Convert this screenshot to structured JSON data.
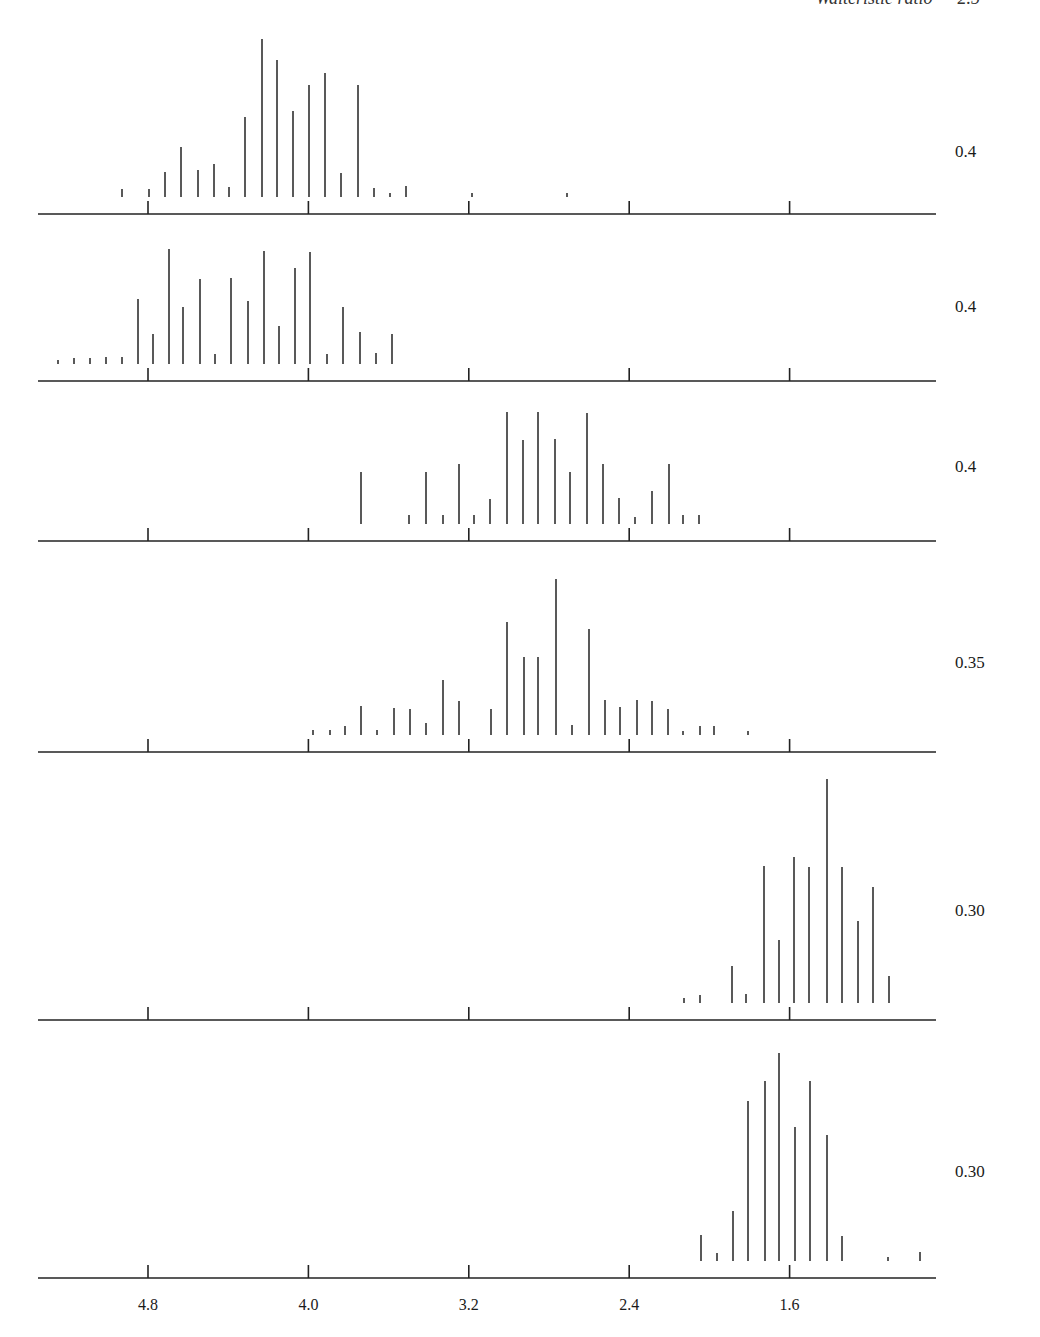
{
  "header": {
    "text": "Waiteristic ratio — 2.5"
  },
  "axis": {
    "ticks": [
      4.8,
      4.0,
      3.2,
      2.4,
      1.6
    ],
    "tick_labels": [
      "4.8",
      "4.0",
      "3.2",
      "2.4",
      "1.6"
    ],
    "px_per_unit": 200.5,
    "x_at_4_8": 148,
    "x_start": 38,
    "x_end": 936
  },
  "chart_data": {
    "type": "bar",
    "title": "",
    "xlabel": "",
    "ylabel": "",
    "xlim": [
      5.35,
      0.9
    ],
    "grid": false,
    "panels": [
      {
        "label": "0.4",
        "baseline_y": 214,
        "label_y": 152,
        "bars": [
          {
            "x": 122,
            "h": 8
          },
          {
            "x": 149,
            "h": 8
          },
          {
            "x": 165,
            "h": 25
          },
          {
            "x": 181,
            "h": 50
          },
          {
            "x": 198,
            "h": 27
          },
          {
            "x": 214,
            "h": 33
          },
          {
            "x": 229,
            "h": 10
          },
          {
            "x": 245,
            "h": 80
          },
          {
            "x": 262,
            "h": 158
          },
          {
            "x": 277,
            "h": 137
          },
          {
            "x": 293,
            "h": 86
          },
          {
            "x": 309,
            "h": 112
          },
          {
            "x": 325,
            "h": 124
          },
          {
            "x": 341,
            "h": 24
          },
          {
            "x": 358,
            "h": 112
          },
          {
            "x": 374,
            "h": 9
          },
          {
            "x": 390,
            "h": 4
          },
          {
            "x": 406,
            "h": 11
          },
          {
            "x": 472,
            "h": 4
          },
          {
            "x": 567,
            "h": 4
          }
        ]
      },
      {
        "label": "0.4",
        "baseline_y": 381,
        "label_y": 307,
        "bars": [
          {
            "x": 58,
            "h": 4
          },
          {
            "x": 74,
            "h": 6
          },
          {
            "x": 90,
            "h": 6
          },
          {
            "x": 106,
            "h": 7
          },
          {
            "x": 122,
            "h": 7
          },
          {
            "x": 138,
            "h": 65
          },
          {
            "x": 153,
            "h": 30
          },
          {
            "x": 169,
            "h": 115
          },
          {
            "x": 183,
            "h": 57
          },
          {
            "x": 200,
            "h": 85
          },
          {
            "x": 215,
            "h": 10
          },
          {
            "x": 231,
            "h": 86
          },
          {
            "x": 248,
            "h": 63
          },
          {
            "x": 264,
            "h": 113
          },
          {
            "x": 279,
            "h": 38
          },
          {
            "x": 295,
            "h": 96
          },
          {
            "x": 310,
            "h": 112
          },
          {
            "x": 327,
            "h": 10
          },
          {
            "x": 343,
            "h": 57
          },
          {
            "x": 360,
            "h": 32
          },
          {
            "x": 376,
            "h": 11
          },
          {
            "x": 392,
            "h": 30
          }
        ]
      },
      {
        "label": "0.4",
        "baseline_y": 541,
        "label_y": 467,
        "bars": [
          {
            "x": 361,
            "h": 52
          },
          {
            "x": 409,
            "h": 9
          },
          {
            "x": 426,
            "h": 52
          },
          {
            "x": 443,
            "h": 9
          },
          {
            "x": 459,
            "h": 60
          },
          {
            "x": 474,
            "h": 9
          },
          {
            "x": 490,
            "h": 25
          },
          {
            "x": 507,
            "h": 112
          },
          {
            "x": 523,
            "h": 84
          },
          {
            "x": 538,
            "h": 112
          },
          {
            "x": 555,
            "h": 85
          },
          {
            "x": 570,
            "h": 52
          },
          {
            "x": 587,
            "h": 111
          },
          {
            "x": 603,
            "h": 60
          },
          {
            "x": 619,
            "h": 26
          },
          {
            "x": 635,
            "h": 7
          },
          {
            "x": 652,
            "h": 33
          },
          {
            "x": 669,
            "h": 60
          },
          {
            "x": 683,
            "h": 9
          },
          {
            "x": 699,
            "h": 9
          }
        ]
      },
      {
        "label": "0.35",
        "baseline_y": 752,
        "label_y": 663,
        "bars": [
          {
            "x": 313,
            "h": 5
          },
          {
            "x": 330,
            "h": 5
          },
          {
            "x": 345,
            "h": 9
          },
          {
            "x": 361,
            "h": 29
          },
          {
            "x": 377,
            "h": 5
          },
          {
            "x": 394,
            "h": 27
          },
          {
            "x": 410,
            "h": 26
          },
          {
            "x": 426,
            "h": 12
          },
          {
            "x": 443,
            "h": 55
          },
          {
            "x": 459,
            "h": 34
          },
          {
            "x": 491,
            "h": 26
          },
          {
            "x": 507,
            "h": 113
          },
          {
            "x": 524,
            "h": 78
          },
          {
            "x": 538,
            "h": 78
          },
          {
            "x": 556,
            "h": 156
          },
          {
            "x": 572,
            "h": 10
          },
          {
            "x": 589,
            "h": 106
          },
          {
            "x": 605,
            "h": 35
          },
          {
            "x": 620,
            "h": 28
          },
          {
            "x": 637,
            "h": 35
          },
          {
            "x": 652,
            "h": 34
          },
          {
            "x": 668,
            "h": 26
          },
          {
            "x": 683,
            "h": 4
          },
          {
            "x": 700,
            "h": 9
          },
          {
            "x": 714,
            "h": 9
          },
          {
            "x": 748,
            "h": 4
          }
        ]
      },
      {
        "label": "0.30",
        "baseline_y": 1020,
        "label_y": 911,
        "bars": [
          {
            "x": 684,
            "h": 5
          },
          {
            "x": 700,
            "h": 8
          },
          {
            "x": 732,
            "h": 37
          },
          {
            "x": 746,
            "h": 9
          },
          {
            "x": 764,
            "h": 137
          },
          {
            "x": 779,
            "h": 63
          },
          {
            "x": 794,
            "h": 146
          },
          {
            "x": 809,
            "h": 136
          },
          {
            "x": 827,
            "h": 224
          },
          {
            "x": 842,
            "h": 136
          },
          {
            "x": 858,
            "h": 82
          },
          {
            "x": 873,
            "h": 116
          },
          {
            "x": 889,
            "h": 27
          }
        ]
      },
      {
        "label": "0.30",
        "baseline_y": 1278,
        "label_y": 1172,
        "bars": [
          {
            "x": 701,
            "h": 26
          },
          {
            "x": 717,
            "h": 8
          },
          {
            "x": 733,
            "h": 50
          },
          {
            "x": 748,
            "h": 160
          },
          {
            "x": 765,
            "h": 180
          },
          {
            "x": 779,
            "h": 208
          },
          {
            "x": 795,
            "h": 134
          },
          {
            "x": 810,
            "h": 180
          },
          {
            "x": 827,
            "h": 126
          },
          {
            "x": 842,
            "h": 25
          },
          {
            "x": 888,
            "h": 4
          },
          {
            "x": 920,
            "h": 9
          }
        ]
      }
    ]
  }
}
